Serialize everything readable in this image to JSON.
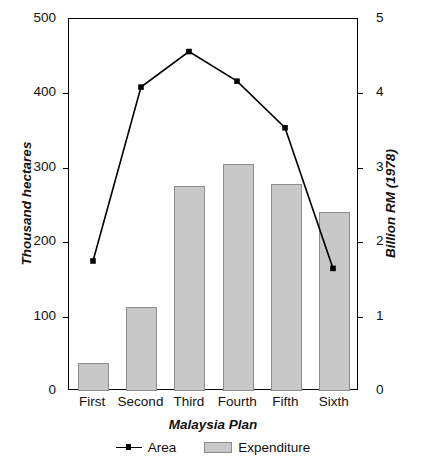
{
  "chart_data": {
    "type": "bar",
    "title": "",
    "categories": [
      "First",
      "Second",
      "Third",
      "Fourth",
      "Fifth",
      "Sixth"
    ],
    "xlabel": "Malaysia Plan",
    "ylabel": "Thousand hectares",
    "ylabel_right": "Billion RM (1978)",
    "ylim": [
      0,
      500
    ],
    "ylim_right": [
      0,
      5
    ],
    "yticks": [
      "0",
      "100",
      "200",
      "300",
      "400",
      "500"
    ],
    "ytick_values": [
      0,
      100,
      200,
      300,
      400,
      500
    ],
    "yticks_right": [
      "0",
      "1",
      "2",
      "3",
      "4",
      "5"
    ],
    "ytick_values_right": [
      0,
      1,
      2,
      3,
      4,
      5
    ],
    "grid": false,
    "legend_position": "below-axis",
    "series": [
      {
        "name": "Expenditure",
        "type": "bar",
        "axis": "right",
        "unit": "Billion RM (1978)",
        "color": "#c8c8c8",
        "edge_color": "#8c8c8c",
        "values": [
          0.37,
          1.13,
          2.75,
          3.05,
          2.78,
          2.4
        ]
      },
      {
        "name": "Area",
        "type": "line",
        "axis": "left",
        "unit": "Thousand hectares",
        "color": "#000000",
        "marker": "square",
        "values": [
          173,
          408,
          456,
          416,
          353,
          163
        ]
      }
    ]
  },
  "legend": {
    "entries": [
      {
        "label": "Area",
        "marker": "line-marker"
      },
      {
        "label": "Expenditure",
        "marker": "swatch"
      }
    ]
  },
  "caption": {
    "text": ""
  }
}
